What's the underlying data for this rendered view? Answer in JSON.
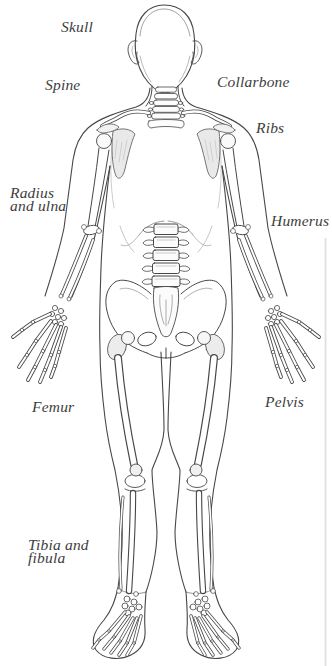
{
  "figure": {
    "kind": "anatomical-diagram",
    "colors": {
      "background": "#ffffff",
      "line": "#474747",
      "faint_line": "#c9c9c9",
      "shading": "#ececec",
      "label_text": "#3d3d3d",
      "page_edge_artifact": "#e3e3e3"
    },
    "labels": [
      {
        "id": "skull",
        "text": "Skull"
      },
      {
        "id": "spine",
        "text": "Spine"
      },
      {
        "id": "collarbone",
        "text": "Collarbone"
      },
      {
        "id": "ribs",
        "text": "Ribs"
      },
      {
        "id": "radius-ulna",
        "text": "Radius\nand ulna"
      },
      {
        "id": "humerus",
        "text": "Humerus"
      },
      {
        "id": "femur",
        "text": "Femur"
      },
      {
        "id": "pelvis",
        "text": "Pelvis"
      },
      {
        "id": "tibia-fibula",
        "text": "Tibia and\nfibula"
      }
    ]
  }
}
